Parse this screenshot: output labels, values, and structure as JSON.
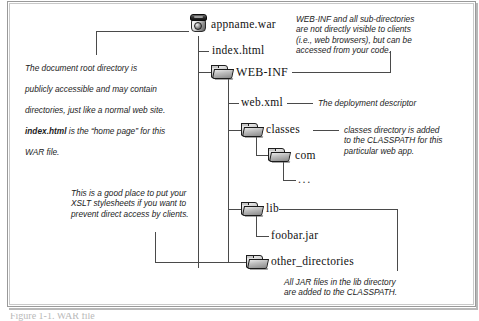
{
  "figure": {
    "caption": "Figure 1-1. WAR file"
  },
  "tree": {
    "nodes": [
      {
        "id": "war",
        "label": "appname.war",
        "icon": "jar-icon",
        "depth": 0
      },
      {
        "id": "index",
        "label": "index.html",
        "icon": "none",
        "depth": 1
      },
      {
        "id": "webinf",
        "label": "WEB-INF",
        "icon": "folder-icon",
        "depth": 1
      },
      {
        "id": "webxml",
        "label": "web.xml",
        "icon": "none",
        "depth": 2
      },
      {
        "id": "classes",
        "label": "classes",
        "icon": "folder-icon",
        "depth": 2
      },
      {
        "id": "com",
        "label": "com",
        "icon": "folder-icon",
        "depth": 3
      },
      {
        "id": "dots",
        "label": "...",
        "icon": "none",
        "depth": 4
      },
      {
        "id": "lib",
        "label": "lib",
        "icon": "folder-icon",
        "depth": 2
      },
      {
        "id": "foobar",
        "label": "foobar.jar",
        "icon": "none",
        "depth": 3
      },
      {
        "id": "otherdirs",
        "label": "other_directories",
        "icon": "folder-icon",
        "depth": 2
      }
    ]
  },
  "annotations": {
    "doc_root": {
      "line1": "The document root directory is",
      "line2": "publicly accessible and may contain",
      "line3": "directories, just like a normal web site.",
      "line4_bold": "index.html",
      "line4_rest": " is the “home page” for this",
      "line5": "WAR file."
    },
    "webinf": "WEB-INF and all sub-directories\nare not directly visible to clients\n(i.e., web browsers), but can be\naccessed from your code.",
    "webxml": "The deployment descriptor",
    "classes": "classes directory is added\nto the CLASSPATH for this\nparticular web app.",
    "xslt": "This is a good place to put your\nXSLT stylesheets if you want to\nprevent direct access by clients.",
    "jars": "All JAR files in the lib directory\nare added to the CLASSPATH."
  },
  "colors": {
    "line": "#4a4a4a",
    "frame": "#9a9a9a",
    "text": "#111111",
    "background": "#ffffff"
  }
}
